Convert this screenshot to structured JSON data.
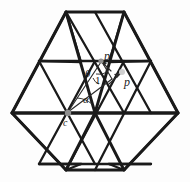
{
  "figure": {
    "background_color": "#fdfdfd",
    "line_color": "#1a1a1a",
    "annotation_color": "#2b2b2b",
    "vertex_marker_color": "#8f8f8f",
    "width": 190,
    "height": 182
  },
  "labels": {
    "p_prime": "p′",
    "p": "p",
    "theta": "θ",
    "one": "1",
    "alpha": "α",
    "c": "c"
  },
  "geometry": {
    "description": "Regular hexagon subdivided into 24 congruent equilateral triangles",
    "center_vertex": {
      "name": "c",
      "x": 68,
      "y": 113
    },
    "target_vertex": {
      "name": "p-prime",
      "x": 103,
      "y": 60
    },
    "direction_point": {
      "name": "p",
      "x": 122,
      "y": 72
    },
    "hexagon_vertices": [
      {
        "x": 66,
        "y": 12
      },
      {
        "x": 124,
        "y": 12
      },
      {
        "x": 178,
        "y": 113
      },
      {
        "x": 124,
        "y": 170
      },
      {
        "x": 66,
        "y": 170
      },
      {
        "x": 12,
        "y": 113
      }
    ],
    "unit_length_label": "1",
    "angle_at_p_prime": "θ",
    "angle_at_c": "α"
  }
}
